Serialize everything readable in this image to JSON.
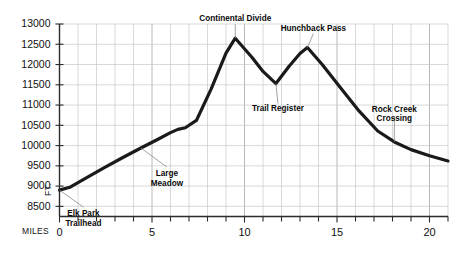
{
  "chart_data": {
    "type": "line",
    "title": "",
    "xlabel": "MILES",
    "ylabel": "FT.",
    "xlim": [
      0,
      21
    ],
    "ylim": [
      8250,
      13000
    ],
    "grid": true,
    "legend": "none",
    "x_ticks_major": [
      0,
      5,
      10,
      15,
      20
    ],
    "x_tick_labels": [
      "0",
      "5",
      "10",
      "15",
      "20"
    ],
    "x_tick_step_minor": 1,
    "y_ticks": [
      8500,
      9000,
      9500,
      10000,
      10500,
      11000,
      11500,
      12000,
      12500,
      13000
    ],
    "y_tick_labels": [
      "8500",
      "9000",
      "9500",
      "10000",
      "10500",
      "11000",
      "11500",
      "12000",
      "12500",
      "13000"
    ],
    "series": [
      {
        "name": "Trail elevation profile",
        "x": [
          0.0,
          0.6,
          1.4,
          2.4,
          3.4,
          4.4,
          5.3,
          6.0,
          6.4,
          6.8,
          7.4,
          8.2,
          9.0,
          9.5,
          10.4,
          11.0,
          11.7,
          12.4,
          13.0,
          13.4,
          14.2,
          15.2,
          16.2,
          17.2,
          18.1,
          19.0,
          20.0,
          21.0
        ],
        "y": [
          8900,
          8980,
          9190,
          9450,
          9700,
          9940,
          10150,
          10320,
          10400,
          10440,
          10620,
          11400,
          12280,
          12650,
          12180,
          11830,
          11530,
          11950,
          12270,
          12420,
          12000,
          11420,
          10850,
          10360,
          10090,
          9900,
          9750,
          9620
        ]
      }
    ],
    "annotations": [
      {
        "label": "Elk Park\nTrailhead",
        "line1": "Elk Park",
        "line2": "Trailhead",
        "x": 0.0,
        "y": 8900
      },
      {
        "label": "Large\nMeadow",
        "line1": "Large",
        "line2": "Meadow",
        "x": 4.4,
        "y": 9940
      },
      {
        "label": "Continental Divide",
        "line1": "Continental Divide",
        "line2": "",
        "x": 9.5,
        "y": 12650
      },
      {
        "label": "Trail Register",
        "line1": "Trail Register",
        "line2": "",
        "x": 11.7,
        "y": 11530
      },
      {
        "label": "Hunchback Pass",
        "line1": "Hunchback Pass",
        "line2": "",
        "x": 13.4,
        "y": 12420
      },
      {
        "label": "Rock Creek\nCrossing",
        "line1": "Rock Creek",
        "line2": "Crossing",
        "x": 18.1,
        "y": 10090
      }
    ]
  },
  "axis": {
    "y_unit": "FT.",
    "x_unit": "MILES"
  },
  "colors": {
    "line": "#1a1a1a",
    "grid_minor": "#c9c9c9",
    "grid_major": "#b0b0b0",
    "axis": "#2b2b2b",
    "background": "#ffffff",
    "text": "#111111"
  }
}
